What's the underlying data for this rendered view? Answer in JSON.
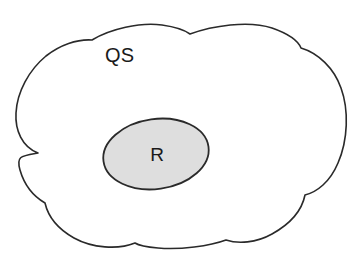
{
  "diagram": {
    "type": "set-containment-venn",
    "background_color": "#ffffff",
    "outer_region": {
      "label": "QS",
      "shape": "cloud",
      "fill_color": "#ffffff",
      "stroke_color": "#2a2a2a",
      "stroke_width": 1.6,
      "label_x": 105,
      "label_y": 57
    },
    "inner_region": {
      "label": "R",
      "shape": "ellipse",
      "fill_color": "#dedede",
      "stroke_color": "#2a2a2a",
      "stroke_width": 1.8,
      "center_x": 156,
      "center_y": 154,
      "radius_x": 53,
      "radius_y": 35,
      "rotation_deg": -8,
      "label_x": 157,
      "label_y": 156
    },
    "relationship": "R is a subset of QS"
  }
}
